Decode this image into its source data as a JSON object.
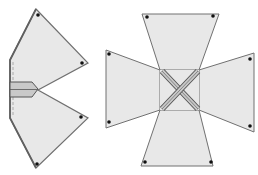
{
  "diagram": {
    "title": "",
    "colors": {
      "panel_fill": "#e8e8e8",
      "panel_stroke": "#707070",
      "tab_fill": "#c8c8c8",
      "tab_stroke": "#555555",
      "dot": "#111111",
      "dash": "#888888",
      "background": "#ffffff"
    },
    "figures": [
      {
        "id": "folded-net",
        "description": "Net folded in half along vertical crease with tab",
        "panels": 2,
        "corner_dots": 4
      },
      {
        "id": "unfolded-net",
        "description": "Cross-shaped net with four trapezoid panels joined by crossed tabs",
        "panels": 4,
        "corner_dots": 8
      }
    ]
  }
}
